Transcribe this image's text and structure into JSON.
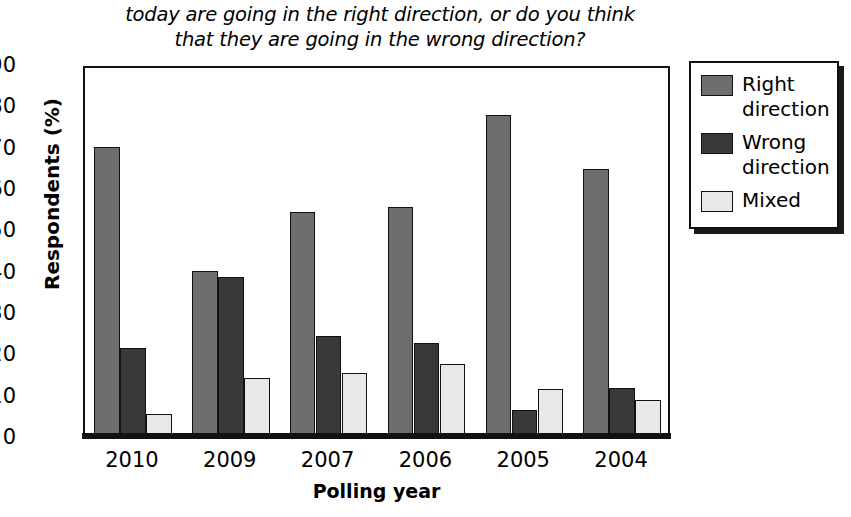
{
  "chart_data": {
    "type": "bar",
    "title": "today are going in the right direction, or do you think that they are going in the wrong direction?",
    "title_lines": [
      "today are going in the right direction, or do you think",
      "that they are going in the wrong direction?"
    ],
    "xlabel": "Polling year",
    "ylabel": "Respondents (%)",
    "categories": [
      "2010",
      "2009",
      "2007",
      "2006",
      "2005",
      "2004"
    ],
    "series": [
      {
        "name": "Right direction",
        "color": "#6e6e6e",
        "values": [
          70.0,
          40.0,
          54.2,
          55.3,
          77.6,
          64.5
        ]
      },
      {
        "name": "Wrong direction",
        "color": "#393939",
        "values": [
          21.3,
          38.4,
          24.2,
          22.5,
          6.4,
          11.6
        ]
      },
      {
        "name": "Mixed",
        "color": "#e8e8e8",
        "values": [
          5.4,
          14.1,
          15.2,
          17.4,
          11.4,
          8.7
        ]
      }
    ],
    "legend_entries": [
      {
        "label": "Right direction",
        "label_lines": [
          "Right",
          "direction"
        ],
        "color": "#6e6e6e"
      },
      {
        "label": "Wrong direction",
        "label_lines": [
          "Wrong",
          "direction"
        ],
        "color": "#393939"
      },
      {
        "label": "Mixed",
        "label_lines": [
          "Mixed"
        ],
        "color": "#e8e8e8"
      }
    ],
    "ylim": [
      0,
      90
    ],
    "yticks": [
      0,
      10,
      20,
      30,
      40,
      50,
      60,
      70,
      80,
      90
    ],
    "ytick_labels": [
      "0",
      "10",
      "20",
      "30",
      "40",
      "50",
      "60",
      "70",
      "80",
      "90"
    ],
    "grid": false,
    "legend_position": "right"
  },
  "footer": {
    "cropped_text": ""
  }
}
